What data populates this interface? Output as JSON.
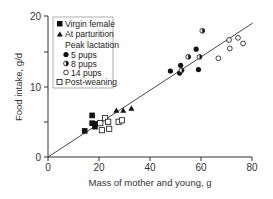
{
  "chart_data": {
    "type": "scatter",
    "title": "",
    "xlabel": "Mass of mother and young, g",
    "ylabel": "Food intake, g/d",
    "xlim": [
      0,
      80
    ],
    "ylim": [
      0,
      20
    ],
    "x_ticks": [
      0,
      20,
      40,
      60,
      80
    ],
    "y_ticks": [
      0,
      10,
      20
    ],
    "y_minor_ticks": [
      5,
      15
    ],
    "grid": false,
    "legend_position": "upper left",
    "legend": {
      "virgin": "Virgin female",
      "parturition": "At parturition",
      "peak_header": "Peak lactation",
      "pups5": "5 pups",
      "pups8": "8 pups",
      "pups14": "14 pups",
      "postweaning": "Post-weaning"
    },
    "series": [
      {
        "name": "Virgin female",
        "marker": "filled-square",
        "points": [
          [
            14.4,
            3.7
          ],
          [
            17.3,
            5.9
          ],
          [
            17.3,
            4.8
          ],
          [
            18.6,
            4.7
          ],
          [
            18.4,
            4.3
          ]
        ]
      },
      {
        "name": "At parturition",
        "marker": "filled-triangle",
        "points": [
          [
            26.8,
            6.6
          ],
          [
            29.5,
            6.6
          ],
          [
            32.7,
            6.9
          ]
        ]
      },
      {
        "name": "Peak lactation - 5 pups",
        "marker": "filled-circle",
        "points": [
          [
            48.0,
            12.2
          ],
          [
            52.0,
            13.0
          ],
          [
            51.6,
            11.9
          ],
          [
            58.1,
            15.3
          ],
          [
            59.0,
            12.4
          ]
        ]
      },
      {
        "name": "Peak lactation - 8 pups",
        "marker": "half-filled-circle",
        "points": [
          [
            52.4,
            12.3
          ],
          [
            55.0,
            14.2
          ],
          [
            59.4,
            14.2
          ],
          [
            60.5,
            17.9
          ]
        ]
      },
      {
        "name": "Peak lactation - 14 pups",
        "marker": "open-circle",
        "points": [
          [
            66.8,
            14.0
          ],
          [
            71.0,
            16.6
          ],
          [
            71.3,
            15.4
          ],
          [
            74.5,
            16.9
          ],
          [
            76.5,
            16.1
          ]
        ]
      },
      {
        "name": "Post-weaning",
        "marker": "open-square",
        "points": [
          [
            20.5,
            4.8
          ],
          [
            21.1,
            3.8
          ],
          [
            22.4,
            5.5
          ],
          [
            23.6,
            5.0
          ],
          [
            24.0,
            4.0
          ],
          [
            27.7,
            5.0
          ],
          [
            29.0,
            5.2
          ]
        ]
      }
    ],
    "regression_line": {
      "x": [
        0,
        80.3
      ],
      "y": [
        0,
        19.0
      ]
    }
  }
}
